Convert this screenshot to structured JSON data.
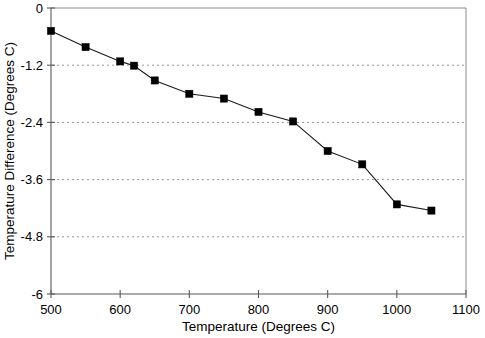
{
  "chart_data": {
    "type": "line",
    "title": "",
    "subtitle": "",
    "xlabel": "Temperature (Degrees C)",
    "ylabel": "Temperature Difference (Degrees C)",
    "x": [
      500,
      550,
      600,
      620,
      650,
      700,
      750,
      800,
      850,
      900,
      950,
      1000,
      1050
    ],
    "values": [
      -0.48,
      -0.82,
      -1.12,
      -1.21,
      -1.52,
      -1.8,
      -1.9,
      -2.18,
      -2.38,
      -3.0,
      -3.28,
      -4.12,
      -4.25
    ],
    "series": [
      {
        "name": "Temperature Difference",
        "values": [
          -0.48,
          -0.82,
          -1.12,
          -1.21,
          -1.52,
          -1.8,
          -1.9,
          -2.18,
          -2.38,
          -3.0,
          -3.28,
          -4.12,
          -4.25
        ]
      }
    ],
    "xlim": [
      500,
      1100
    ],
    "ylim": [
      -6,
      0
    ],
    "xticks": [
      500,
      600,
      700,
      800,
      900,
      1000,
      1100
    ],
    "yticks": [
      0,
      -1.2,
      -2.4,
      -3.6,
      -4.8,
      -6
    ],
    "xtick_labels": [
      "500",
      "600",
      "700",
      "800",
      "900",
      "1000",
      "1100"
    ],
    "ytick_labels": [
      "0",
      "-1.2",
      "-2.4",
      "-3.6",
      "-4.8",
      "-6"
    ],
    "grid": "horizontal-dotted",
    "grid_values": [
      -1.2,
      -2.4,
      -3.6,
      -4.8
    ],
    "legend": null,
    "legend_position": "none",
    "marker": "filled-square",
    "marker_color": "#000000",
    "line_color": "#1a1a1a",
    "background_color": "#ffffff",
    "annotations": []
  },
  "axes": {
    "x_title": "Temperature (Degrees C)",
    "y_title": "Temperature Difference (Degrees C)"
  }
}
